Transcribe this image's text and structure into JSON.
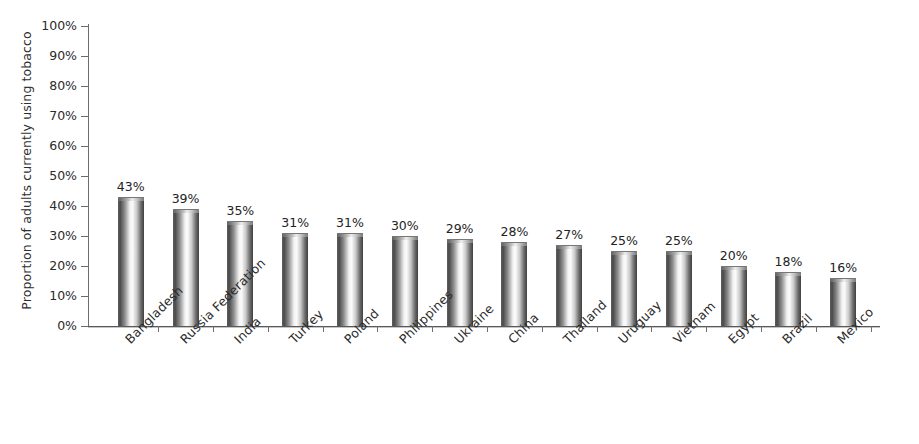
{
  "chart_data": {
    "type": "bar",
    "title": "",
    "subtitle": "",
    "xlabel": "",
    "ylabel": "Proportion of adults currently using tobacco",
    "ylim": [
      0,
      100
    ],
    "yunit": "%",
    "grid": false,
    "legend": null,
    "categories": [
      "Bangladesh",
      "Russia Federation",
      "India",
      "Turkey",
      "Poland",
      "Philippines",
      "Ukraine",
      "China",
      "Thailand",
      "Uruguay",
      "Vietnam",
      "Egypt",
      "Brazil",
      "Mexico"
    ],
    "values": [
      43,
      39,
      35,
      31,
      31,
      30,
      29,
      28,
      27,
      25,
      25,
      20,
      18,
      16
    ],
    "data_labels": [
      "43%",
      "39%",
      "35%",
      "31%",
      "31%",
      "30%",
      "29%",
      "28%",
      "27%",
      "25%",
      "25%",
      "20%",
      "18%",
      "16%"
    ],
    "y_ticks": [
      0,
      10,
      20,
      30,
      40,
      50,
      60,
      70,
      80,
      90,
      100
    ],
    "y_tick_labels": [
      "0%",
      "10%",
      "20%",
      "30%",
      "40%",
      "50%",
      "60%",
      "70%",
      "80%",
      "90%",
      "100%"
    ],
    "bar_style": "3d-cylinder",
    "colors": {
      "bar_dark": "#4a4a4a",
      "bar_light": "#fbfbfb",
      "axis": "#6b6b6b",
      "text": "#2b2b2b",
      "background": "#ffffff"
    }
  }
}
